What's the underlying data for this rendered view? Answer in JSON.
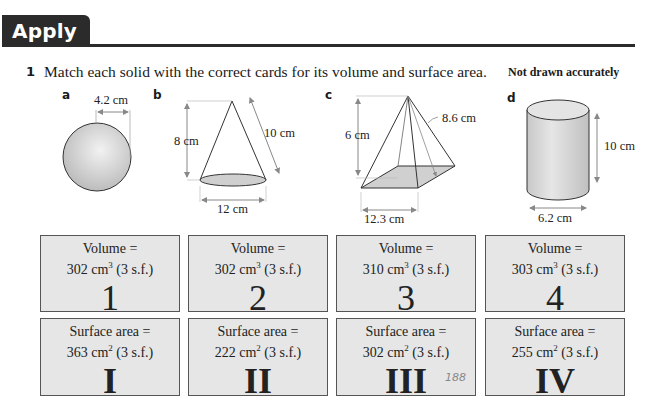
{
  "header": {
    "title": "Apply 7"
  },
  "question": {
    "number": "1",
    "text": "Match each solid with the correct cards for its volume and surface area.",
    "note": "Not drawn accurately"
  },
  "solids": [
    {
      "label": "a",
      "shape": "sphere",
      "dims": {
        "radius": "4.2 cm"
      }
    },
    {
      "label": "b",
      "shape": "cone",
      "dims": {
        "height": "8 cm",
        "slant": "10 cm",
        "diameter": "12 cm"
      }
    },
    {
      "label": "c",
      "shape": "square-pyramid",
      "dims": {
        "height": "6 cm",
        "slant": "8.6 cm",
        "base": "12.3 cm"
      }
    },
    {
      "label": "d",
      "shape": "cylinder",
      "dims": {
        "height": "10 cm",
        "diameter": "6.2 cm"
      }
    }
  ],
  "volume_cards": [
    {
      "title": "Volume =",
      "value": "302 cm",
      "power": "3",
      "suffix": " (3 s.f.)",
      "id": "1"
    },
    {
      "title": "Volume =",
      "value": "302 cm",
      "power": "3",
      "suffix": " (3 s.f.)",
      "id": "2"
    },
    {
      "title": "Volume =",
      "value": "310 cm",
      "power": "3",
      "suffix": " (3 s.f.)",
      "id": "3"
    },
    {
      "title": "Volume =",
      "value": "303 cm",
      "power": "3",
      "suffix": " (3 s.f.)",
      "id": "4"
    }
  ],
  "surface_cards": [
    {
      "title": "Surface area =",
      "value": "363 cm",
      "power": "2",
      "suffix": " (3 s.f.)",
      "id": "I"
    },
    {
      "title": "Surface area =",
      "value": "222 cm",
      "power": "2",
      "suffix": " (3 s.f.)",
      "id": "II"
    },
    {
      "title": "Surface area =",
      "value": "302 cm",
      "power": "2",
      "suffix": " (3 s.f.)",
      "id": "III",
      "annotation": "188"
    },
    {
      "title": "Surface area =",
      "value": "255 cm",
      "power": "2",
      "suffix": " (3 s.f.)",
      "id": "IV"
    }
  ],
  "colors": {
    "header_bg": "#2b2b2b",
    "card_bg": "#e6e6e6",
    "card_border": "#555555"
  }
}
